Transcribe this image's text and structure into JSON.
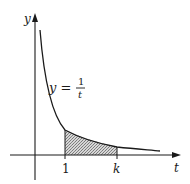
{
  "figure": {
    "axes": {
      "y_label": "y",
      "x_label": "t"
    },
    "curve": {
      "equation_lhs": "y =",
      "numerator": "1",
      "denominator": "t"
    },
    "ticks": {
      "lower": "1",
      "upper": "k"
    },
    "colors": {
      "ink": "#1a1a1a",
      "shade": "#9a9a9a",
      "background": "#ffffff"
    }
  }
}
